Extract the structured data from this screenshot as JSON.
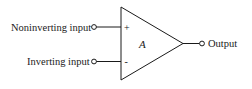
{
  "diagram": {
    "type": "op-amp symbol",
    "gain_label": "A",
    "inputs": [
      {
        "label": "Noninverting input",
        "sign": "+"
      },
      {
        "label": "Inverting input",
        "sign": "-"
      }
    ],
    "output": {
      "label": "Output"
    },
    "colors": {
      "line": "#1a1a1a",
      "background": "#ffffff"
    }
  }
}
